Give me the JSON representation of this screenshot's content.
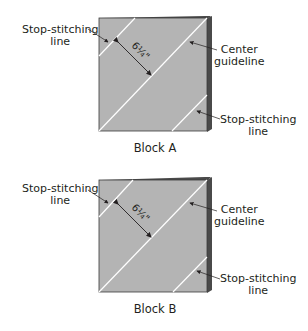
{
  "figure": {
    "blocks": [
      {
        "id": "A",
        "caption": "Block A",
        "measurement": "6¼\"",
        "labels": {
          "top_left": [
            "Stop-stitching",
            "line"
          ],
          "center": [
            "Center",
            "guideline"
          ],
          "bottom_right": [
            "Stop-stitching",
            "line"
          ]
        }
      },
      {
        "id": "B",
        "caption": "Block B",
        "measurement": "6¼\"",
        "labels": {
          "top_left": [
            "Stop-stitching",
            "line"
          ],
          "center": [
            "Center",
            "guideline"
          ],
          "bottom_right": [
            "Stop-stitching",
            "line"
          ]
        }
      }
    ],
    "colors": {
      "fabric": "#b4b4b4",
      "edge": "#4a4a4a",
      "stitch_line": "#ffffff",
      "text": "#231f20"
    }
  }
}
